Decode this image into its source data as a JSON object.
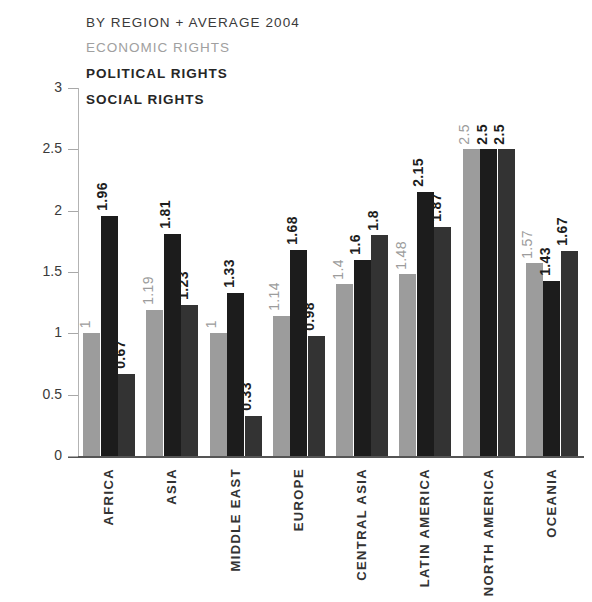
{
  "header": {
    "title": "BY REGION + AVERAGE 2004",
    "legend": [
      {
        "label": "ECONOMIC RIGHTS",
        "key": "economic",
        "color": "#9c9c9c"
      },
      {
        "label": "POLITICAL RIGHTS",
        "key": "political",
        "color": "#1c1c1c"
      },
      {
        "label": "SOCIAL RIGHTS",
        "key": "social",
        "color": "#333333"
      }
    ]
  },
  "axis": {
    "y_ticks": [
      "0",
      "0.5",
      "1",
      "1.5",
      "2",
      "2.5",
      "3"
    ]
  },
  "chart_data": {
    "type": "bar",
    "title": "BY REGION + AVERAGE 2004",
    "xlabel": "",
    "ylabel": "",
    "ylim": [
      0,
      3
    ],
    "ytick_values": [
      0,
      0.5,
      1,
      1.5,
      2,
      2.5,
      3
    ],
    "grid": false,
    "legend_position": "top-left",
    "categories": [
      "AFRICA",
      "ASIA",
      "MIDDLE EAST",
      "EUROPE",
      "CENTRAL ASIA",
      "LATIN AMERICA",
      "NORTH AMERICA",
      "OCEANIA"
    ],
    "series": [
      {
        "name": "ECONOMIC RIGHTS",
        "color": "#9c9c9c",
        "values": [
          1,
          1.19,
          1,
          1.14,
          1.4,
          1.48,
          2.5,
          1.57
        ],
        "labels": [
          "1",
          "1.19",
          "1",
          "1.14",
          "1.4",
          "1.48",
          "2.5",
          "1.57"
        ]
      },
      {
        "name": "POLITICAL RIGHTS",
        "color": "#1c1c1c",
        "values": [
          1.96,
          1.81,
          1.33,
          1.68,
          1.6,
          2.15,
          2.5,
          1.43
        ],
        "labels": [
          "1.96",
          "1.81",
          "1.33",
          "1.68",
          "1.6",
          "2.15",
          "2.5",
          "1.43"
        ]
      },
      {
        "name": "SOCIAL RIGHTS",
        "color": "#333333",
        "values": [
          0.67,
          1.23,
          0.33,
          0.98,
          1.8,
          1.87,
          2.5,
          1.67
        ],
        "labels": [
          "0.67",
          "1.23",
          "0.33",
          "0.98",
          "1.8",
          "1.87",
          "2.5",
          "1.67"
        ]
      }
    ]
  }
}
